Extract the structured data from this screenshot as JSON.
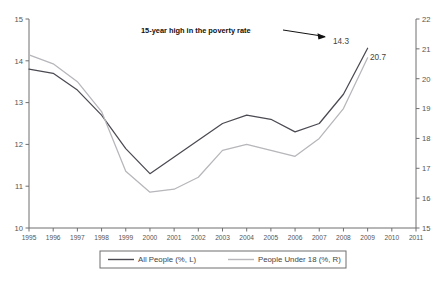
{
  "chart_data": {
    "type": "line",
    "title": "",
    "xlabel": "",
    "ylabel": "",
    "grid": false,
    "legend_position": "bottom",
    "x": [
      1995,
      1996,
      1997,
      1998,
      1999,
      2000,
      2001,
      2002,
      2003,
      2004,
      2005,
      2006,
      2007,
      2008,
      2009
    ],
    "x_ticks": [
      "1995",
      "1996",
      "1997",
      "1998",
      "1999",
      "2000",
      "2001",
      "2002",
      "2003",
      "2004",
      "2005",
      "2006",
      "2007",
      "2008",
      "2009",
      "2010",
      "2011"
    ],
    "x_range": [
      1995,
      2011
    ],
    "left_axis": {
      "ticks": [
        "10",
        "11",
        "12",
        "13",
        "14",
        "15"
      ],
      "values": [
        10,
        11,
        12,
        13,
        14,
        15
      ],
      "range": [
        10,
        15
      ]
    },
    "right_axis": {
      "ticks": [
        "15",
        "16",
        "17",
        "18",
        "19",
        "20",
        "21",
        "22"
      ],
      "values": [
        15,
        16,
        17,
        18,
        19,
        20,
        21,
        22
      ],
      "range": [
        15,
        22
      ]
    },
    "series": [
      {
        "name": "All People (%, L)",
        "axis": "left",
        "color": "#4a4a52",
        "values": [
          13.8,
          13.7,
          13.3,
          12.7,
          11.9,
          11.3,
          11.7,
          12.1,
          12.5,
          12.7,
          12.6,
          12.3,
          12.5,
          13.2,
          14.3
        ]
      },
      {
        "name": "People Under 18 (%, R)",
        "axis": "right",
        "color": "#b6b6bb",
        "values": [
          20.8,
          20.5,
          19.9,
          18.9,
          16.9,
          16.2,
          16.3,
          16.7,
          17.6,
          17.8,
          17.6,
          17.4,
          18.0,
          19.0,
          20.7
        ]
      }
    ],
    "annotations": [
      {
        "name": "poverty-high-note",
        "text": "15-year high in the poverty rate",
        "has_arrow": true
      }
    ],
    "point_labels": [
      {
        "name": "all-people-2009-label",
        "text": "14.3"
      },
      {
        "name": "under18-2009-label",
        "text": "20.7"
      }
    ]
  },
  "legend": {
    "items": [
      {
        "label": "All People (%, L)",
        "color": "#4a4a52"
      },
      {
        "label": "People Under 18 (%, R)",
        "color": "#b6b6bb"
      }
    ]
  },
  "colors": {
    "axis": "#6f6f6f",
    "series_dark": "#4a4a52",
    "series_light": "#b6b6bb",
    "text": "#555555",
    "annotation": "#111111",
    "background": "#ffffff"
  }
}
